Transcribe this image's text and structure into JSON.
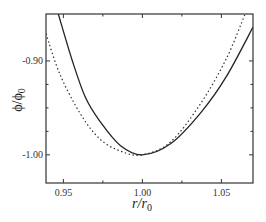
{
  "chart_data": {
    "type": "line",
    "title": "",
    "xlabel": "r/r0",
    "ylabel": "ϕ/ϕ0",
    "xlabel_parts": {
      "main": "r/r",
      "sub": "0"
    },
    "ylabel_parts": {
      "main": "ϕ/ϕ",
      "sub": "0"
    },
    "xlim": [
      0.939,
      1.07
    ],
    "ylim": [
      -1.03,
      -0.85
    ],
    "x_ticks": [
      0.95,
      1.0,
      1.05
    ],
    "x_tick_labels": [
      "0.95",
      "1.00",
      "1.05"
    ],
    "x_minor_ticks": [
      0.975,
      1.025
    ],
    "y_ticks": [
      -0.9,
      -1.0
    ],
    "y_tick_labels": [
      "-0.90",
      "-1.00"
    ],
    "y_minor_ticks": [
      -0.925,
      -0.95,
      -0.975
    ],
    "grid": false,
    "legend": null,
    "series": [
      {
        "name": "solid",
        "style": "solid",
        "color": "#222222",
        "x": [
          0.9468,
          0.9557,
          0.964,
          0.973,
          0.986,
          1.0,
          1.018,
          1.037,
          1.053,
          1.07
        ],
        "y": [
          -0.85,
          -0.9,
          -0.939,
          -0.964,
          -0.99,
          -1.0,
          -0.988,
          -0.955,
          -0.917,
          -0.864
        ]
      },
      {
        "name": "dotted",
        "style": "dotted",
        "color": "#333333",
        "x": [
          0.939,
          0.948,
          0.961,
          0.973,
          0.986,
          1.0,
          1.018,
          1.037,
          1.053,
          1.065
        ],
        "y": [
          -0.871,
          -0.915,
          -0.957,
          -0.983,
          -0.996,
          -1.0,
          -0.986,
          -0.945,
          -0.898,
          -0.85
        ]
      }
    ]
  }
}
